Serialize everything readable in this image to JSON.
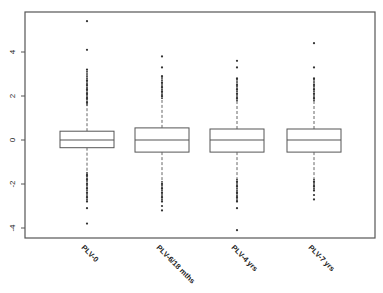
{
  "chart_data": {
    "type": "box",
    "title": "",
    "xlabel": "",
    "ylabel": "",
    "ylim": [
      -4.5,
      5.8
    ],
    "yticks": [
      -4,
      -2,
      0,
      2,
      4
    ],
    "ytick_labels": [
      "-4",
      "-2",
      "0",
      "2",
      "4"
    ],
    "grid": false,
    "categories": [
      "PLV-0",
      "PLV-6/18 mths",
      "PLV-4 yrs",
      "PLV-7 yrs"
    ],
    "series": [
      {
        "name": "PLV-0",
        "q1": -0.35,
        "median": 0.0,
        "q3": 0.4,
        "whisker_low": -1.5,
        "whisker_high": 1.6,
        "outliers_high": [
          1.7,
          1.9,
          2.1,
          2.3,
          2.5,
          2.7,
          3.2,
          4.1,
          5.4
        ],
        "outliers_low": [
          -1.6,
          -1.8,
          -2.0,
          -2.2,
          -2.4,
          -2.6,
          -2.8,
          -3.1,
          -3.8
        ]
      },
      {
        "name": "PLV-6/18 mths",
        "q1": -0.55,
        "median": 0.0,
        "q3": 0.55,
        "whisker_low": -1.9,
        "whisker_high": 1.9,
        "outliers_high": [
          2.0,
          2.2,
          2.4,
          2.6,
          2.9,
          3.3,
          3.8
        ],
        "outliers_low": [
          -2.0,
          -2.2,
          -2.4,
          -2.6,
          -2.8,
          -3.0,
          -3.2
        ]
      },
      {
        "name": "PLV-4 yrs",
        "q1": -0.55,
        "median": 0.0,
        "q3": 0.5,
        "whisker_low": -1.8,
        "whisker_high": 1.8,
        "outliers_high": [
          1.9,
          2.1,
          2.3,
          2.5,
          2.8,
          3.3,
          3.6
        ],
        "outliers_low": [
          -1.9,
          -2.1,
          -2.4,
          -2.6,
          -2.8,
          -3.1,
          -4.1
        ]
      },
      {
        "name": "PLV-7 yrs",
        "q1": -0.55,
        "median": 0.0,
        "q3": 0.5,
        "whisker_low": -1.8,
        "whisker_high": 1.8,
        "outliers_high": [
          1.9,
          2.1,
          2.3,
          2.5,
          2.8,
          3.3,
          4.4
        ],
        "outliers_low": [
          -1.9,
          -2.1,
          -2.3,
          -2.5,
          -2.7
        ]
      }
    ]
  },
  "colors": {
    "frame": "#555555",
    "box": "#555555",
    "points": "#333333",
    "background": "#ffffff"
  }
}
